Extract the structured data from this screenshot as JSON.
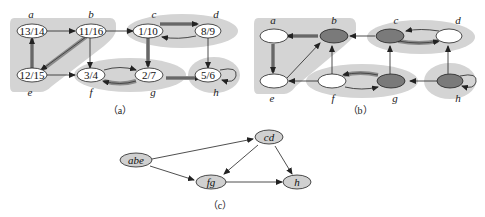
{
  "figure": {
    "panels": [
      {
        "id": "a",
        "caption": "（a）",
        "description": "Depth-first search with discovery/finishing times; strongly connected components shaded",
        "vertices": [
          {
            "name": "a",
            "label": "13/14"
          },
          {
            "name": "b",
            "label": "11/16"
          },
          {
            "name": "c",
            "label": "1/10"
          },
          {
            "name": "d",
            "label": "8/9"
          },
          {
            "name": "e",
            "label": "12/15"
          },
          {
            "name": "f",
            "label": "3/4"
          },
          {
            "name": "g",
            "label": "2/7"
          },
          {
            "name": "h",
            "label": "5/6"
          }
        ],
        "edges": [
          {
            "from": "a",
            "to": "b",
            "tree": false
          },
          {
            "from": "b",
            "to": "c",
            "tree": false
          },
          {
            "from": "b",
            "to": "e",
            "tree": true
          },
          {
            "from": "b",
            "to": "f",
            "tree": false
          },
          {
            "from": "c",
            "to": "d",
            "tree": true
          },
          {
            "from": "c",
            "to": "g",
            "tree": true
          },
          {
            "from": "d",
            "to": "c",
            "tree": false
          },
          {
            "from": "d",
            "to": "h",
            "tree": false
          },
          {
            "from": "e",
            "to": "a",
            "tree": true
          },
          {
            "from": "e",
            "to": "f",
            "tree": false
          },
          {
            "from": "f",
            "to": "g",
            "tree": false
          },
          {
            "from": "g",
            "to": "f",
            "tree": true
          },
          {
            "from": "g",
            "to": "h",
            "tree": true
          },
          {
            "from": "h",
            "to": "h",
            "tree": false
          }
        ],
        "components": [
          [
            "a",
            "b",
            "e"
          ],
          [
            "c",
            "d"
          ],
          [
            "f",
            "g"
          ],
          [
            "h"
          ]
        ]
      },
      {
        "id": "b",
        "caption": "（b）",
        "description": "Transpose graph with DFS forest; roots darkly shaded",
        "vertices": [
          {
            "name": "a",
            "root": false
          },
          {
            "name": "b",
            "root": true
          },
          {
            "name": "c",
            "root": true
          },
          {
            "name": "d",
            "root": false
          },
          {
            "name": "e",
            "root": false
          },
          {
            "name": "f",
            "root": false
          },
          {
            "name": "g",
            "root": true
          },
          {
            "name": "h",
            "root": true
          }
        ]
      },
      {
        "id": "c",
        "caption": "（c）",
        "description": "Component graph",
        "vertices": [
          {
            "name": "abe"
          },
          {
            "name": "cd"
          },
          {
            "name": "fg"
          },
          {
            "name": "h"
          }
        ],
        "edges": [
          {
            "from": "abe",
            "to": "cd"
          },
          {
            "from": "abe",
            "to": "fg"
          },
          {
            "from": "cd",
            "to": "fg"
          },
          {
            "from": "cd",
            "to": "h"
          },
          {
            "from": "fg",
            "to": "h"
          }
        ]
      }
    ],
    "colors": {
      "component_shade": "#d4d4d4",
      "root_fill": "#7a7a7a",
      "node_fill": "#ffffff",
      "cnode_fill": "#d0d0d0",
      "tree_edge": "#8a8a8a",
      "edge": "#222222"
    }
  }
}
